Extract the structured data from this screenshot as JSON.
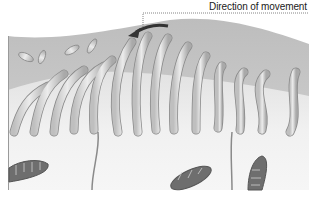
{
  "figure": {
    "annotations": [
      {
        "id": "direction",
        "text": "Direction of movement"
      }
    ],
    "elements": {
      "cilia_count": 14,
      "detached_particles": 4,
      "mitochondria": 3
    },
    "colors": {
      "mucus_layer": "#c9c9c9",
      "cell_body": "#f0f0f0",
      "cilia_fill": "#dcdcdc",
      "cilia_stroke": "#8a8a8a",
      "mitochondria_fill": "#6e6e6e",
      "arrow": "#333333"
    }
  }
}
